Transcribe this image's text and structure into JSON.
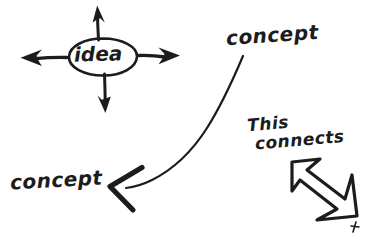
{
  "canvas": {
    "width": 367,
    "height": 236,
    "background_color": "#ffffff",
    "ink_color": "#1c1c1c",
    "style": "hand-drawn marker sketch"
  },
  "labels": {
    "idea": "idea",
    "concept_top_right": "concept",
    "concept_bottom_left": "concept",
    "this_connects_line1": "This",
    "this_connects_line2": "connects"
  },
  "shapes": {
    "idea_ellipse": "ellipse around the word idea",
    "arrow_up": "up-arrow-from-idea",
    "arrow_down": "down-arrow-from-idea",
    "arrow_left": "left-arrow-from-idea",
    "arrow_right": "right-arrow-from-idea",
    "sweep_curve": "long curved connector from top-right concept down to bottom-left arrowhead",
    "left_arrowhead": "large open V arrowhead pointing left",
    "block_arrow": "thick hollow arrow pointing down-right",
    "stray_tick": "small stray pen mark at bottom right"
  }
}
